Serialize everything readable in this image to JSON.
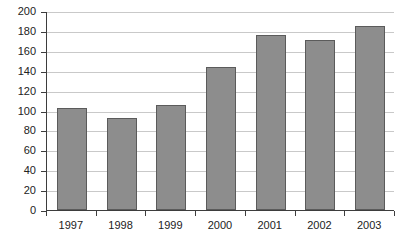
{
  "chart_data": {
    "type": "bar",
    "title": "",
    "xlabel": "",
    "ylabel": "",
    "categories": [
      "1997",
      "1998",
      "1999",
      "2000",
      "2001",
      "2002",
      "2003"
    ],
    "values": [
      103,
      92,
      106,
      144,
      176,
      171,
      185
    ],
    "ylim": [
      0,
      200
    ],
    "ytick_labels": [
      "0",
      "20",
      "40",
      "60",
      "80",
      "100",
      "120",
      "140",
      "160",
      "180",
      "200"
    ],
    "ytick_values": [
      0,
      20,
      40,
      60,
      80,
      100,
      120,
      140,
      160,
      180,
      200
    ],
    "grid": true,
    "legend": false,
    "legend_position": "none",
    "series": [
      {
        "name": "",
        "values": [
          103,
          92,
          106,
          144,
          176,
          171,
          185
        ]
      }
    ],
    "colors": {
      "bar_fill": "#8d8d8d",
      "bar_border": "#5b5b5b",
      "gridline": "#c9c9c9",
      "axis": "#3d3d3d",
      "text": "#222222",
      "background": "#ffffff"
    }
  },
  "caption": {
    "text": ""
  }
}
